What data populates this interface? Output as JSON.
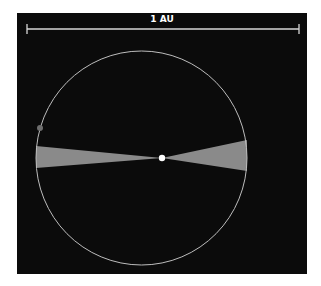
{
  "scale_bar": {
    "label": "1 AU",
    "x1": 27,
    "x2": 299,
    "y": 29,
    "tick_half": 5,
    "color": "#d8d8d8"
  },
  "orbit": {
    "cx": 141.5,
    "cy": 158,
    "rx": 105.5,
    "ry": 107,
    "stroke": "#bdbdbd"
  },
  "star": {
    "cx": 162,
    "cy": 158,
    "r": 3.2,
    "color": "#ffffff"
  },
  "planet": {
    "cx": 40,
    "cy": 128,
    "r": 3,
    "color": "#6e6e6e"
  },
  "wedges": {
    "color": "#8a8a8a",
    "left": {
      "tip": [
        162,
        158
      ],
      "outer_top": [
        36,
        146
      ],
      "outer_bottom": [
        36,
        168
      ]
    },
    "right": {
      "tip": [
        162,
        158
      ],
      "outer_top": [
        247,
        140
      ],
      "outer_bottom": [
        247,
        171
      ]
    }
  },
  "colors": {
    "panel_bg": "#0b0b0b",
    "page_bg": "#ffffff"
  }
}
